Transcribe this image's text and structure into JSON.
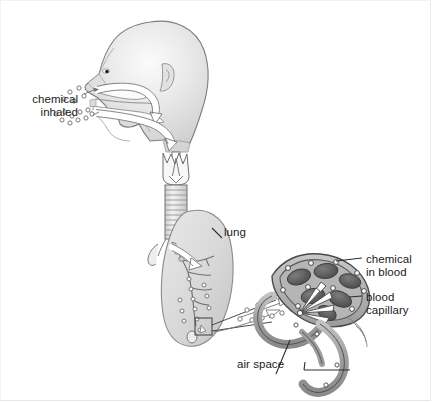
{
  "figure": {
    "labels": {
      "chemical_inhaled": "chemical\ninhaled",
      "lung": "lung",
      "chemical_in_blood": "chemical\nin blood",
      "blood_capillary": "blood\ncapillary",
      "air_space": "air space"
    },
    "colors": {
      "background": "#ffffff",
      "outline": "#4a4a4a",
      "text": "#1c1c1c",
      "skin_light": "#ebebeb",
      "skin_mid": "#d9d9d9",
      "skin_shadow": "#bfbfbf",
      "lung_fill": "#dcdcdc",
      "lung_edge": "#9a9a9a",
      "capillary_wall": "#a8a8a8",
      "capillary_lumen": "#8f8f8f",
      "blood_cell": "#5e5e5e",
      "particle_stroke": "#6b6b6b",
      "arrow_white": "#ffffff",
      "border": "#f0f0f0"
    },
    "structures": [
      "head-profile",
      "nasal-cavity",
      "oral-cavity",
      "larynx",
      "trachea",
      "bronchi",
      "lung",
      "alveolus-callout-box",
      "alveolar-capillary",
      "red-blood-cells",
      "air-space-tube",
      "chemical-particles"
    ]
  }
}
